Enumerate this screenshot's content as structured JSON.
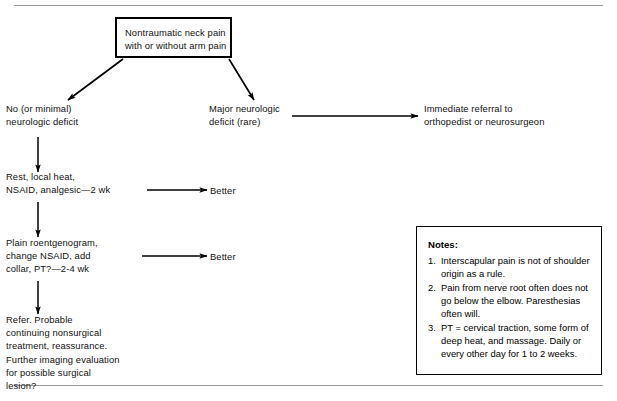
{
  "chart_data": {
    "type": "diagram",
    "nodes": [
      {
        "id": "root",
        "label": "Nontraumatic neck pain\nwith or without arm pain",
        "shape": "box"
      },
      {
        "id": "no-deficit",
        "label": "No (or minimal)\nneurologic deficit",
        "shape": "text"
      },
      {
        "id": "major-deficit",
        "label": "Major neurologic\ndeficit (rare)",
        "shape": "text"
      },
      {
        "id": "referral",
        "label": "Immediate referral to\northopedist or neurosurgeon",
        "shape": "text"
      },
      {
        "id": "rest",
        "label": "Rest, local heat,\nNSAID, analgesic—2 wk",
        "shape": "text"
      },
      {
        "id": "better1",
        "label": "Better",
        "shape": "text"
      },
      {
        "id": "roentgenogram",
        "label": "Plain roentgenogram,\nchange NSAID, add\ncollar, PT?—2-4 wk",
        "shape": "text"
      },
      {
        "id": "better2",
        "label": "Better",
        "shape": "text"
      },
      {
        "id": "refer",
        "label": "Refer. Probable\ncontinuing nonsurgical\ntreatment, reassurance.\nFurther imaging evaluation\nfor possible surgical\nlesion?",
        "shape": "text"
      }
    ],
    "edges": [
      {
        "from": "root",
        "to": "no-deficit",
        "style": "diagonal-arrow"
      },
      {
        "from": "root",
        "to": "major-deficit",
        "style": "diagonal-arrow"
      },
      {
        "from": "major-deficit",
        "to": "referral",
        "style": "horizontal-arrow"
      },
      {
        "from": "no-deficit",
        "to": "rest",
        "style": "vertical-arrow"
      },
      {
        "from": "rest",
        "to": "better1",
        "style": "horizontal-arrow"
      },
      {
        "from": "rest",
        "to": "roentgenogram",
        "style": "vertical-arrow"
      },
      {
        "from": "roentgenogram",
        "to": "better2",
        "style": "horizontal-arrow"
      },
      {
        "from": "roentgenogram",
        "to": "refer",
        "style": "vertical-arrow"
      }
    ]
  },
  "flowchart": {
    "root_box": "Nontraumatic neck pain\nwith or without arm pain",
    "no_deficit": "No (or minimal)\nneurologic deficit",
    "major_deficit": "Major neurologic\ndeficit (rare)",
    "referral": "Immediate referral to\northopedist or neurosurgeon",
    "rest_treatment": "Rest, local heat,\nNSAID, analgesic—2 wk",
    "better_1": "Better",
    "roentgenogram": "Plain roentgenogram,\nchange NSAID, add\ncollar, PT?—2-4 wk",
    "better_2": "Better",
    "refer_block": "Refer. Probable\ncontinuing nonsurgical\ntreatment, reassurance.\nFurther imaging evaluation\nfor possible surgical\nlesion?"
  },
  "notes": {
    "title": "Notes:",
    "items": [
      {
        "number": "1.",
        "text": "Interscapular pain is not of shoulder origin as a rule."
      },
      {
        "number": "2.",
        "text": "Pain from nerve root often does not go below the elbow. Paresthesias often will."
      },
      {
        "number": "3.",
        "text": "PT = cervical traction, some form of deep heat, and massage. Daily or every other day for 1 to 2 weeks."
      }
    ]
  },
  "colors": {
    "ink": "#000000",
    "rule": "#9a9a9a",
    "background": "#ffffff"
  }
}
